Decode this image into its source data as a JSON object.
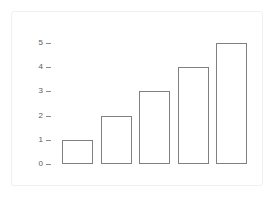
{
  "figure": {
    "background_color": "#ffffff",
    "frame_color": "#f0f0f0",
    "bar_stroke_color": "#808080",
    "bar_fill_color": "#ffffff",
    "tick_color": "#8a8a8a",
    "label_color": "#5a5a5a"
  },
  "chart_data": {
    "type": "bar",
    "title": "",
    "subtitle": "",
    "xlabel": "",
    "ylabel": "",
    "categories": [
      "1",
      "2",
      "3",
      "4",
      "5"
    ],
    "values": [
      1,
      2,
      3,
      4,
      5
    ],
    "ylim": [
      0,
      5
    ],
    "yticks": [
      0,
      1,
      2,
      3,
      4,
      5
    ],
    "ytick_labels": [
      "0",
      "1",
      "2",
      "3",
      "4",
      "5"
    ],
    "xticks": [],
    "xtick_labels": [],
    "grid": false,
    "legend": null,
    "legend_position": "none",
    "annotations": [],
    "bar_orientation": "vertical",
    "bar_style": "outline"
  }
}
